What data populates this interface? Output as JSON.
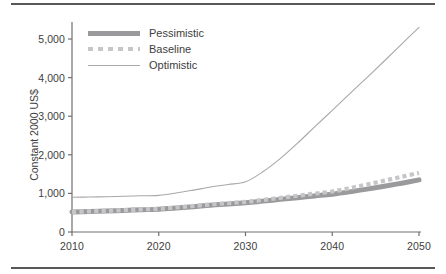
{
  "chart_data": {
    "type": "line",
    "title": "",
    "xlabel": "",
    "ylabel": "Constant 2000 US$",
    "xlim": [
      2010,
      2050
    ],
    "ylim": [
      0,
      5300
    ],
    "grid": false,
    "legend_position": "top-left",
    "x_ticks": [
      "2010",
      "2020",
      "2030",
      "2040",
      "2050"
    ],
    "x_tick_values": [
      2010,
      2020,
      2030,
      2040,
      2050
    ],
    "y_ticks": [
      "0",
      "1,000",
      "2,000",
      "3,000",
      "4,000",
      "5,000"
    ],
    "y_tick_values": [
      0,
      1000,
      2000,
      3000,
      4000,
      5000
    ],
    "x": [
      2010,
      2012,
      2014,
      2016,
      2018,
      2020,
      2022,
      2024,
      2026,
      2028,
      2030,
      2032,
      2034,
      2036,
      2038,
      2040,
      2042,
      2044,
      2046,
      2048,
      2050
    ],
    "series": [
      {
        "name": "Pessimistic",
        "style": "thick-solid",
        "color": "#9a9a9c",
        "values": [
          520,
          530,
          545,
          560,
          575,
          590,
          620,
          655,
          695,
          725,
          760,
          800,
          845,
          890,
          935,
          980,
          1040,
          1110,
          1185,
          1265,
          1350
        ]
      },
      {
        "name": "Baseline",
        "style": "dotted",
        "color": "#c6c6c8",
        "values": [
          520,
          535,
          550,
          565,
          585,
          600,
          635,
          675,
          715,
          748,
          780,
          830,
          885,
          940,
          995,
          1050,
          1135,
          1230,
          1330,
          1430,
          1530
        ]
      },
      {
        "name": "Optimistic",
        "style": "thin-solid",
        "color": "#a8a8aa",
        "values": [
          900,
          905,
          915,
          925,
          938,
          950,
          1010,
          1085,
          1165,
          1230,
          1300,
          1560,
          1900,
          2300,
          2730,
          3150,
          3580,
          4000,
          4430,
          4870,
          5300
        ]
      }
    ]
  },
  "legend": {
    "items": [
      {
        "label": "Pessimistic",
        "key": "thick-line-key"
      },
      {
        "label": "Baseline",
        "key": "dotted-line-key"
      },
      {
        "label": "Optimistic",
        "key": "thin-line-key"
      }
    ]
  },
  "colors": {
    "rule": "#58585a",
    "axis": "#6f6f71",
    "text": "#3d3d3d",
    "background": "#ffffff"
  }
}
